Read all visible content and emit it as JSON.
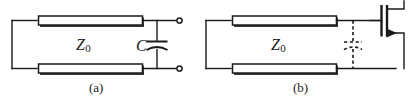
{
  "figure": {
    "type": "circuit-diagram",
    "background_color": "#ffffff",
    "line_color": "#1a1a1a",
    "panels": [
      {
        "id": "a",
        "caption": "(a)",
        "line_label": "Z",
        "line_label_sub": "0",
        "component_label": "C",
        "components": [
          "transmission-line-top",
          "transmission-line-bottom",
          "shunt-capacitor",
          "output-terminal-top",
          "output-terminal-bottom"
        ]
      },
      {
        "id": "b",
        "caption": "(b)",
        "line_label": "Z",
        "line_label_sub": "0",
        "component_label": "",
        "components": [
          "transmission-line-top",
          "transmission-line-bottom",
          "parasitic-capacitor-dashed",
          "fet-transistor"
        ]
      }
    ]
  }
}
